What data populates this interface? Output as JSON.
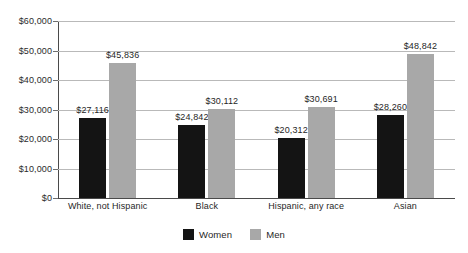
{
  "chart_data": {
    "type": "bar",
    "title": "",
    "xlabel": "",
    "ylabel": "",
    "ylim": [
      0,
      60000
    ],
    "grid": true,
    "legend_position": "bottom",
    "categories": [
      "White, not Hispanic",
      "Black",
      "Hispanic, any race",
      "Asian"
    ],
    "ytick_labels": [
      "$0",
      "$10,000",
      "$20,000",
      "$30,000",
      "$40,000",
      "$50,000",
      "$60,000"
    ],
    "ytick_values": [
      0,
      10000,
      20000,
      30000,
      40000,
      50000,
      60000
    ],
    "series": [
      {
        "name": "Women",
        "color": "#141414",
        "values": [
          27116,
          24842,
          20312,
          28260
        ],
        "labels": [
          "$27,116",
          "$24,842",
          "$20,312",
          "$28,260"
        ]
      },
      {
        "name": "Men",
        "color": "#a8a8a8",
        "values": [
          45836,
          30112,
          30691,
          48842
        ],
        "labels": [
          "$45,836",
          "$30,112",
          "$30,691",
          "$48,842"
        ]
      }
    ]
  },
  "legend": {
    "items": [
      {
        "label": "Women",
        "swatch": "women-swatch"
      },
      {
        "label": "Men",
        "swatch": "men-swatch"
      }
    ]
  }
}
